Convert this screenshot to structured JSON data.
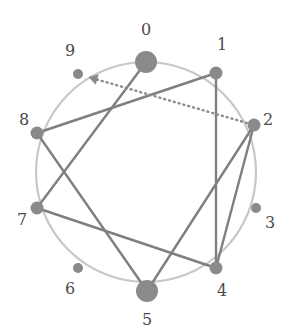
{
  "figure": {
    "type": "circular-graph-diagram",
    "background_color": "#ffffff",
    "center": {
      "x": 146,
      "y": 172
    },
    "radius": 110,
    "ring": {
      "name": "layout-circle",
      "color": "#c8c8c8",
      "stroke_width": 2.2
    },
    "palette": {
      "node_fill": "#8a8a8a",
      "edge_stroke": "#7f7f7f",
      "dotted_edge_stroke": "#8a8a8a",
      "ring_stroke": "#c8c8c8",
      "label_color": "#4a4a4a"
    }
  },
  "nodes": [
    {
      "id": "0",
      "label": "0",
      "x": 146,
      "y": 62,
      "r": 11,
      "size": "large",
      "label_x": 146,
      "label_y": 30,
      "label_pos": "top"
    },
    {
      "id": "1",
      "label": "1",
      "x": 216,
      "y": 73,
      "r": 6.5,
      "size": "medium",
      "label_x": 222,
      "label_y": 45,
      "label_pos": "top-right"
    },
    {
      "id": "2",
      "label": "2",
      "x": 254,
      "y": 125,
      "r": 6.5,
      "size": "medium",
      "label_x": 268,
      "label_y": 120,
      "label_pos": "right"
    },
    {
      "id": "3",
      "label": "3",
      "x": 256,
      "y": 208,
      "r": 5,
      "size": "small",
      "label_x": 270,
      "label_y": 223,
      "label_pos": "right"
    },
    {
      "id": "4",
      "label": "4",
      "x": 216,
      "y": 268,
      "r": 6.5,
      "size": "medium",
      "label_x": 222,
      "label_y": 291,
      "label_pos": "bottom-right"
    },
    {
      "id": "5",
      "label": "5",
      "x": 147,
      "y": 291,
      "r": 11,
      "size": "large",
      "label_x": 147,
      "label_y": 320,
      "label_pos": "bottom"
    },
    {
      "id": "6",
      "label": "6",
      "x": 78,
      "y": 268,
      "r": 5,
      "size": "small",
      "label_x": 70,
      "label_y": 289,
      "label_pos": "bottom-left"
    },
    {
      "id": "7",
      "label": "7",
      "x": 37,
      "y": 208,
      "r": 6.5,
      "size": "medium",
      "label_x": 22,
      "label_y": 220,
      "label_pos": "left"
    },
    {
      "id": "8",
      "label": "8",
      "x": 37,
      "y": 133,
      "r": 6.5,
      "size": "medium",
      "label_x": 24,
      "label_y": 120,
      "label_pos": "left"
    },
    {
      "id": "9",
      "label": "9",
      "x": 78,
      "y": 74,
      "r": 5,
      "size": "small",
      "label_x": 70,
      "label_y": 51,
      "label_pos": "top-left"
    }
  ],
  "edges": [
    {
      "id": "e-0-7",
      "source": "0",
      "target": "7",
      "style": "solid",
      "directed": false,
      "stroke": "#7f7f7f",
      "width": 2.4
    },
    {
      "id": "e-1-8",
      "source": "1",
      "target": "8",
      "style": "solid",
      "directed": false,
      "stroke": "#7f7f7f",
      "width": 2.4
    },
    {
      "id": "e-1-4",
      "source": "1",
      "target": "4",
      "style": "solid",
      "directed": false,
      "stroke": "#7f7f7f",
      "width": 2.4
    },
    {
      "id": "e-2-4",
      "source": "2",
      "target": "4",
      "style": "solid",
      "directed": false,
      "stroke": "#7f7f7f",
      "width": 2.4
    },
    {
      "id": "e-2-5",
      "source": "2",
      "target": "5",
      "style": "solid",
      "directed": false,
      "stroke": "#7f7f7f",
      "width": 2.4
    },
    {
      "id": "e-4-7",
      "source": "4",
      "target": "7",
      "style": "solid",
      "directed": false,
      "stroke": "#7f7f7f",
      "width": 2.4
    },
    {
      "id": "e-5-8",
      "source": "5",
      "target": "8",
      "style": "solid",
      "directed": false,
      "stroke": "#7f7f7f",
      "width": 2.4
    },
    {
      "id": "e-2-9",
      "source": "2",
      "target": "9",
      "style": "dotted",
      "directed": true,
      "stroke": "#8a8a8a",
      "width": 2.4,
      "dash": "1 4"
    }
  ]
}
